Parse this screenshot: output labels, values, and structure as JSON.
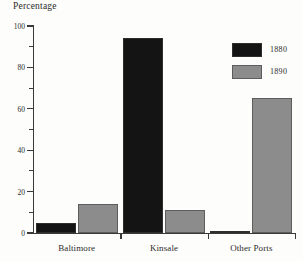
{
  "chart_data": {
    "type": "bar",
    "title": "",
    "xlabel": "",
    "ylabel": "Percentage",
    "ylim": [
      0,
      100
    ],
    "ytick_labels": [
      "0",
      "20",
      "40",
      "60",
      "80",
      "100"
    ],
    "ytick_values": [
      0,
      20,
      40,
      60,
      80,
      100
    ],
    "yminor_values": [
      10,
      30,
      50,
      70,
      90
    ],
    "grid": false,
    "legend_position": "upper-right",
    "categories": [
      "Baltimore",
      "Kinsale",
      "Other Ports"
    ],
    "series": [
      {
        "name": "1880",
        "color": "#141414",
        "values": [
          5,
          94,
          0.5
        ]
      },
      {
        "name": "1890",
        "color": "#8c8c8c",
        "values": [
          14,
          11,
          65
        ]
      }
    ]
  },
  "axis": {
    "y_title": "Percentage"
  },
  "legend": {
    "items": [
      {
        "label": "1880"
      },
      {
        "label": "1890"
      }
    ]
  }
}
